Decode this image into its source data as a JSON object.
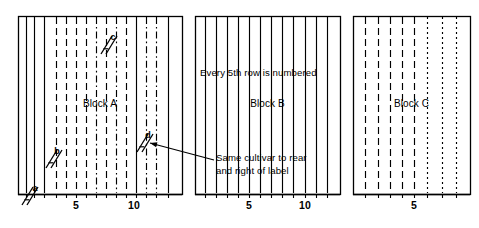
{
  "figure": {
    "stroke_color": "#000000",
    "background_color": "#ffffff"
  },
  "blocks": [
    {
      "id": "A",
      "label": "Block A",
      "x": 18,
      "y": 16,
      "width": 164,
      "height": 178,
      "axis_ticks": [
        {
          "label": "5",
          "x": 76
        },
        {
          "label": "10",
          "x": 134
        }
      ],
      "rows": [
        {
          "x": 26,
          "style": "solid"
        },
        {
          "x": 34,
          "style": "solid"
        },
        {
          "x": 44,
          "style": "solid"
        },
        {
          "x": 56,
          "style": "dashed"
        },
        {
          "x": 66,
          "style": "dashed"
        },
        {
          "x": 76,
          "style": "dashed"
        },
        {
          "x": 86,
          "style": "dashed"
        },
        {
          "x": 96,
          "style": "dashdot"
        },
        {
          "x": 106,
          "style": "dashed"
        },
        {
          "x": 116,
          "style": "dashdot"
        },
        {
          "x": 126,
          "style": "dashed"
        },
        {
          "x": 136,
          "style": "solid"
        },
        {
          "x": 146,
          "style": "dashdot"
        },
        {
          "x": 156,
          "style": "dashdot"
        },
        {
          "x": 168,
          "style": "solid"
        }
      ]
    },
    {
      "id": "B",
      "label": "Block B",
      "x": 195,
      "y": 16,
      "width": 145,
      "height": 178,
      "axis_ticks": [
        {
          "label": "5",
          "x": 249
        },
        {
          "label": "10",
          "x": 305
        }
      ],
      "rows": [
        {
          "x": 205,
          "style": "solid"
        },
        {
          "x": 216,
          "style": "solid"
        },
        {
          "x": 227,
          "style": "solid"
        },
        {
          "x": 238,
          "style": "solid"
        },
        {
          "x": 249,
          "style": "solid"
        },
        {
          "x": 260,
          "style": "solid"
        },
        {
          "x": 271,
          "style": "solid"
        },
        {
          "x": 282,
          "style": "solid"
        },
        {
          "x": 293,
          "style": "solid"
        },
        {
          "x": 305,
          "style": "solid"
        },
        {
          "x": 316,
          "style": "solid"
        },
        {
          "x": 327,
          "style": "solid"
        }
      ]
    },
    {
      "id": "C",
      "label": "Block C",
      "x": 353,
      "y": 16,
      "width": 117,
      "height": 178,
      "axis_ticks": [
        {
          "label": "5",
          "x": 414
        }
      ],
      "rows": [
        {
          "x": 365,
          "style": "dashed"
        },
        {
          "x": 378,
          "style": "dashed"
        },
        {
          "x": 390,
          "style": "dashed"
        },
        {
          "x": 402,
          "style": "dashed"
        },
        {
          "x": 414,
          "style": "dashed"
        },
        {
          "x": 427,
          "style": "dotted"
        },
        {
          "x": 442,
          "style": "dotted"
        },
        {
          "x": 456,
          "style": "dotted"
        }
      ]
    }
  ],
  "markers": [
    {
      "id": "a",
      "label": "a",
      "label_x": 35,
      "label_y": 183,
      "hatch_x": 22,
      "hatch_y": 196
    },
    {
      "id": "b",
      "label": "b",
      "label_x": 57,
      "label_y": 146,
      "hatch_x": 46,
      "hatch_y": 159
    },
    {
      "id": "c",
      "label": "c",
      "label_x": 113,
      "label_y": 32,
      "hatch_x": 101,
      "hatch_y": 45
    },
    {
      "id": "d",
      "label": "d",
      "label_x": 148,
      "label_y": 130,
      "hatch_x": 137,
      "hatch_y": 143
    }
  ],
  "annotations": [
    {
      "id": "numbering-note",
      "text": "Every 5th row is numbered",
      "x": 200,
      "y": 67
    },
    {
      "id": "cultivar-note-line1",
      "text": "Same cultivar to rear",
      "x": 216,
      "y": 152
    },
    {
      "id": "cultivar-note-line2",
      "text": "and right of label",
      "x": 216,
      "y": 165
    }
  ],
  "leader_line": {
    "id": "cultivar-leader",
    "from_x": 214,
    "from_y": 160,
    "to_x": 150,
    "to_y": 143
  }
}
